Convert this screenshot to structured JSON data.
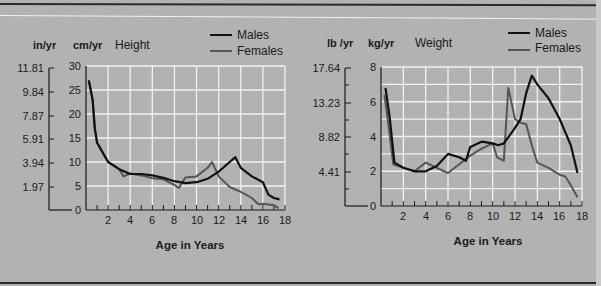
{
  "colors": {
    "background": "#b2b2b2",
    "grid": "#f2f2f2",
    "males": "#111111",
    "females": "#555555",
    "axis": "#1a1a1a"
  },
  "legend": {
    "males": "Males",
    "females": "Females"
  },
  "height_chart": {
    "title": "Height",
    "unit_primary": "cm/yr",
    "unit_secondary": "in/yr",
    "xlabel": "Age in Years",
    "secondary_ticks": [
      "11.81",
      "9.84",
      "7.87",
      "5.91",
      "3.94",
      "1.97"
    ],
    "primary_ticks": [
      "30",
      "25",
      "20",
      "15",
      "10",
      "5",
      "0"
    ],
    "x_ticks": [
      "2",
      "4",
      "6",
      "8",
      "10",
      "12",
      "14",
      "16",
      "18"
    ]
  },
  "weight_chart": {
    "title": "Weight",
    "unit_primary": "kg/yr",
    "unit_secondary": "lb /yr",
    "xlabel": "Age in Years",
    "secondary_ticks": [
      "17.64",
      "13.23",
      "8.82",
      "4.41"
    ],
    "primary_ticks": [
      "8",
      "6",
      "4",
      "2",
      "0"
    ],
    "x_ticks": [
      "2",
      "4",
      "6",
      "8",
      "10",
      "12",
      "14",
      "16",
      "18"
    ]
  },
  "chart_data": [
    {
      "type": "line",
      "title": "Height",
      "xlabel": "Age in Years",
      "ylabel": "cm/yr",
      "ylabel_secondary": "in/yr",
      "xlim": [
        0,
        18
      ],
      "ylim": [
        0,
        30
      ],
      "grid": true,
      "legend_position": "top-right",
      "x_ticks": [
        2,
        4,
        6,
        8,
        10,
        12,
        14,
        16,
        18
      ],
      "y_ticks": [
        0,
        5,
        10,
        15,
        20,
        25,
        30
      ],
      "y_ticks_secondary": [
        1.97,
        3.94,
        5.91,
        7.87,
        9.84,
        11.81
      ],
      "series": [
        {
          "name": "Males",
          "x": [
            0.25,
            0.6,
            0.8,
            1.0,
            1.5,
            2.0,
            3.0,
            4.0,
            5.0,
            6.0,
            7.0,
            8.0,
            9.0,
            10.0,
            11.0,
            12.0,
            13.0,
            13.5,
            14.0,
            15.0,
            16.0,
            16.5,
            17.0,
            17.5
          ],
          "values": [
            27,
            23,
            17,
            14,
            12,
            10,
            8.5,
            7.5,
            7.5,
            7.2,
            6.7,
            6.0,
            5.6,
            5.8,
            6.5,
            8.0,
            10.0,
            11.0,
            8.8,
            7.0,
            5.8,
            3.2,
            2.5,
            2.2
          ]
        },
        {
          "name": "Females",
          "x": [
            0.25,
            0.6,
            0.8,
            1.0,
            1.5,
            2.0,
            3.0,
            3.4,
            4.0,
            5.0,
            6.0,
            7.0,
            8.0,
            8.4,
            9.0,
            10.0,
            11.0,
            11.4,
            12.0,
            13.0,
            14.0,
            15.0,
            15.6,
            16.0,
            17.0,
            17.4
          ],
          "values": [
            27,
            23,
            17,
            14,
            12,
            10,
            8.5,
            7.0,
            7.6,
            7.2,
            6.6,
            6.4,
            5.2,
            4.6,
            6.8,
            7.0,
            8.8,
            10.0,
            7.0,
            4.8,
            3.8,
            2.5,
            1.2,
            1.3,
            1.0,
            0.4
          ]
        }
      ]
    },
    {
      "type": "line",
      "title": "Weight",
      "xlabel": "Age in Years",
      "ylabel": "kg/yr",
      "ylabel_secondary": "lb/yr",
      "xlim": [
        0,
        18
      ],
      "ylim": [
        0,
        8
      ],
      "grid": true,
      "legend_position": "top-right",
      "x_ticks": [
        2,
        4,
        6,
        8,
        10,
        12,
        14,
        16,
        18
      ],
      "y_ticks": [
        0,
        2,
        4,
        6,
        8
      ],
      "y_ticks_secondary": [
        4.41,
        8.82,
        13.23,
        17.64
      ],
      "series": [
        {
          "name": "Males",
          "x": [
            0.4,
            0.8,
            1.2,
            2.0,
            3.0,
            4.0,
            5.0,
            6.0,
            7.0,
            7.6,
            8.0,
            9.0,
            10.0,
            10.5,
            11.0,
            12.0,
            12.5,
            13.0,
            13.5,
            14.0,
            15.0,
            16.0,
            17.0,
            17.6
          ],
          "values": [
            6.8,
            5.0,
            2.5,
            2.2,
            2.0,
            2.0,
            2.3,
            3.0,
            2.8,
            2.6,
            3.4,
            3.7,
            3.6,
            3.5,
            3.6,
            4.5,
            5.0,
            6.5,
            7.5,
            7.0,
            6.2,
            5.0,
            3.5,
            1.9
          ]
        },
        {
          "name": "Females",
          "x": [
            0.3,
            0.7,
            1.1,
            2.0,
            3.0,
            4.0,
            5.0,
            6.0,
            7.0,
            8.0,
            9.0,
            10.0,
            10.4,
            11.0,
            11.4,
            12.0,
            12.5,
            13.0,
            13.5,
            14.0,
            15.0,
            16.0,
            16.5,
            17.0,
            17.6
          ],
          "values": [
            6.4,
            4.5,
            2.4,
            2.2,
            2.0,
            2.5,
            2.2,
            1.9,
            2.4,
            2.9,
            3.3,
            3.6,
            2.8,
            2.6,
            6.8,
            5.0,
            4.8,
            4.7,
            3.5,
            2.5,
            2.2,
            1.8,
            1.7,
            1.2,
            0.5
          ]
        }
      ]
    }
  ]
}
